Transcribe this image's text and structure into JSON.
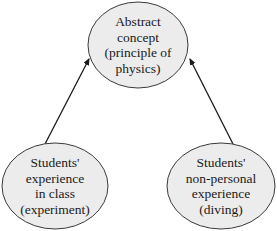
{
  "colors": {
    "node_fill": "#ececec",
    "node_stroke": "#3a3a3a",
    "arrow": "#1a1a1a",
    "text": "#1a1a1a",
    "background": "#ffffff"
  },
  "nodes": [
    {
      "id": "abstract-concept",
      "lines": [
        "Abstract",
        "concept",
        "(principle of",
        "physics)"
      ]
    },
    {
      "id": "experience-in-class",
      "lines": [
        "Students'",
        "experience",
        "in class",
        "(experiment)"
      ]
    },
    {
      "id": "non-personal-experience",
      "lines": [
        "Students'",
        "non-personal",
        "experience",
        "(diving)"
      ]
    }
  ],
  "edges": [
    {
      "from": "experience-in-class",
      "to": "abstract-concept"
    },
    {
      "from": "non-personal-experience",
      "to": "abstract-concept"
    }
  ]
}
